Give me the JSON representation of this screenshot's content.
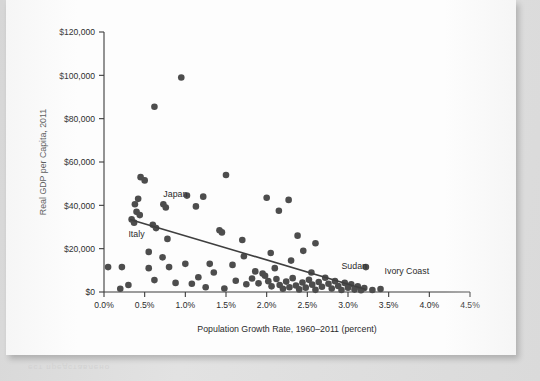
{
  "figure": {
    "background_color": "#dcdcdc",
    "paper_color": "#fdfdfd",
    "dot_color": "#4d4d4d",
    "trend_color": "#3f3f3f",
    "axis_color": "#3c3c3c"
  },
  "chart_data": {
    "type": "scatter",
    "title": "",
    "xlabel": "Population Growth Rate, 1960–2011 (percent)",
    "ylabel": "Real GDP per Capita, 2011",
    "xlim": [
      0.0,
      4.5
    ],
    "ylim": [
      0,
      120000
    ],
    "grid": false,
    "legend": null,
    "xticks": [
      0.0,
      0.5,
      1.0,
      1.5,
      2.0,
      2.5,
      3.0,
      3.5,
      4.0,
      4.5
    ],
    "xtick_labels": [
      "0.0%",
      "0.5%",
      "1.0%",
      "1.5%",
      "2.0%",
      "2.5%",
      "3.0%",
      "3.5%",
      "4.0%",
      "4.5%"
    ],
    "yticks": [
      0,
      20000,
      40000,
      60000,
      80000,
      100000,
      120000
    ],
    "ytick_labels": [
      "$0",
      "$20,000",
      "$40,000",
      "$60,000",
      "$80,000",
      "$100,000",
      "$120,000"
    ],
    "annotations": [
      {
        "label": "Japan",
        "x": 0.73,
        "y": 44000
      },
      {
        "label": "Italy",
        "x": 0.3,
        "y": 25500
      },
      {
        "label": "Sudan",
        "x": 2.92,
        "y": 10500
      },
      {
        "label": "Ivory Coast",
        "x": 3.45,
        "y": 8200
      }
    ],
    "trendline": {
      "x": [
        0.32,
        3.22
      ],
      "y": [
        33500,
        1200
      ]
    },
    "points": [
      {
        "x": 0.95,
        "y": 99000
      },
      {
        "x": 0.62,
        "y": 85500
      },
      {
        "x": 1.5,
        "y": 54000
      },
      {
        "x": 0.45,
        "y": 53000
      },
      {
        "x": 0.5,
        "y": 51500
      },
      {
        "x": 1.02,
        "y": 44500
      },
      {
        "x": 1.22,
        "y": 44000
      },
      {
        "x": 2.0,
        "y": 43500
      },
      {
        "x": 2.27,
        "y": 42500
      },
      {
        "x": 0.42,
        "y": 43000
      },
      {
        "x": 0.38,
        "y": 40500
      },
      {
        "x": 0.73,
        "y": 40500
      },
      {
        "x": 0.76,
        "y": 39000
      },
      {
        "x": 1.13,
        "y": 39500
      },
      {
        "x": 0.4,
        "y": 37000
      },
      {
        "x": 0.44,
        "y": 35500
      },
      {
        "x": 2.15,
        "y": 37500
      },
      {
        "x": 0.34,
        "y": 33500
      },
      {
        "x": 0.37,
        "y": 32000
      },
      {
        "x": 0.6,
        "y": 31000
      },
      {
        "x": 0.64,
        "y": 29500
      },
      {
        "x": 1.42,
        "y": 28500
      },
      {
        "x": 1.45,
        "y": 27500
      },
      {
        "x": 2.38,
        "y": 26000
      },
      {
        "x": 0.78,
        "y": 24500
      },
      {
        "x": 1.7,
        "y": 24000
      },
      {
        "x": 2.6,
        "y": 22500
      },
      {
        "x": 0.55,
        "y": 18500
      },
      {
        "x": 0.72,
        "y": 16000
      },
      {
        "x": 2.45,
        "y": 19000
      },
      {
        "x": 1.0,
        "y": 13000
      },
      {
        "x": 1.3,
        "y": 13000
      },
      {
        "x": 0.05,
        "y": 11500
      },
      {
        "x": 0.22,
        "y": 11500
      },
      {
        "x": 0.55,
        "y": 11000
      },
      {
        "x": 0.8,
        "y": 11500
      },
      {
        "x": 1.58,
        "y": 12500
      },
      {
        "x": 1.86,
        "y": 9500
      },
      {
        "x": 1.95,
        "y": 8500
      },
      {
        "x": 2.1,
        "y": 11000
      },
      {
        "x": 2.55,
        "y": 9000
      },
      {
        "x": 3.22,
        "y": 11500
      },
      {
        "x": 0.62,
        "y": 5500
      },
      {
        "x": 0.88,
        "y": 4200
      },
      {
        "x": 1.08,
        "y": 3800
      },
      {
        "x": 1.16,
        "y": 6800
      },
      {
        "x": 1.62,
        "y": 5200
      },
      {
        "x": 1.75,
        "y": 3600
      },
      {
        "x": 1.82,
        "y": 6200
      },
      {
        "x": 1.9,
        "y": 4000
      },
      {
        "x": 1.98,
        "y": 7500
      },
      {
        "x": 2.02,
        "y": 5000
      },
      {
        "x": 2.06,
        "y": 2600
      },
      {
        "x": 2.12,
        "y": 6000
      },
      {
        "x": 2.16,
        "y": 3200
      },
      {
        "x": 2.2,
        "y": 1500
      },
      {
        "x": 2.24,
        "y": 4800
      },
      {
        "x": 2.28,
        "y": 2200
      },
      {
        "x": 2.32,
        "y": 6400
      },
      {
        "x": 2.36,
        "y": 3000
      },
      {
        "x": 2.4,
        "y": 1200
      },
      {
        "x": 2.44,
        "y": 4400
      },
      {
        "x": 2.48,
        "y": 2000
      },
      {
        "x": 2.52,
        "y": 5600
      },
      {
        "x": 2.56,
        "y": 3400
      },
      {
        "x": 2.6,
        "y": 1000
      },
      {
        "x": 2.64,
        "y": 4600
      },
      {
        "x": 2.68,
        "y": 2400
      },
      {
        "x": 2.72,
        "y": 6600
      },
      {
        "x": 2.76,
        "y": 3800
      },
      {
        "x": 2.8,
        "y": 1600
      },
      {
        "x": 2.84,
        "y": 5000
      },
      {
        "x": 2.88,
        "y": 2800
      },
      {
        "x": 2.92,
        "y": 900
      },
      {
        "x": 2.96,
        "y": 4200
      },
      {
        "x": 3.0,
        "y": 2000
      },
      {
        "x": 3.04,
        "y": 3600
      },
      {
        "x": 3.08,
        "y": 1100
      },
      {
        "x": 3.12,
        "y": 2600
      },
      {
        "x": 3.16,
        "y": 800
      },
      {
        "x": 3.2,
        "y": 1800
      },
      {
        "x": 3.3,
        "y": 900
      },
      {
        "x": 3.4,
        "y": 1400
      },
      {
        "x": 2.05,
        "y": 18000
      },
      {
        "x": 2.3,
        "y": 14500
      },
      {
        "x": 1.72,
        "y": 16500
      },
      {
        "x": 1.35,
        "y": 9000
      },
      {
        "x": 0.3,
        "y": 3200
      },
      {
        "x": 0.2,
        "y": 1500
      },
      {
        "x": 1.25,
        "y": 2200
      },
      {
        "x": 1.48,
        "y": 1600
      }
    ]
  },
  "bleed_text": "ест представлено"
}
